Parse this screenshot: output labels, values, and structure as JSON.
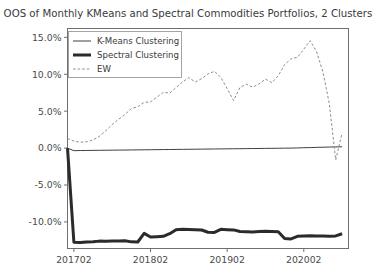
{
  "chart_data": {
    "type": "line",
    "title": "OOS of Monthly KMeans and Spectral Commodities Portfolios, 2 Clusters",
    "xlabel": "",
    "ylabel": "",
    "grid": false,
    "legend_position": "upper left",
    "xlim": [
      0,
      44
    ],
    "ylim": [
      -13.6,
      16.2
    ],
    "ytick_labels": [
      "15.0%",
      "10.0%",
      "5.0%",
      "0.0%",
      "-5.0%",
      "-10.0%"
    ],
    "ytick_values": [
      15.0,
      10.0,
      5.0,
      0.0,
      -5.0,
      -10.0
    ],
    "xtick_labels": [
      "201702",
      "201802",
      "201902",
      "202002"
    ],
    "xtick_values": [
      1,
      13,
      25,
      37
    ],
    "x": [
      0,
      1,
      2,
      3,
      4,
      5,
      6,
      7,
      8,
      9,
      10,
      11,
      12,
      13,
      14,
      15,
      16,
      17,
      18,
      19,
      20,
      21,
      22,
      23,
      24,
      25,
      26,
      27,
      28,
      29,
      30,
      31,
      32,
      33,
      34,
      35,
      36,
      37,
      38,
      39,
      40,
      41,
      42,
      43
    ],
    "series": [
      {
        "name": "K-Means Clustering",
        "style": "solid-thin",
        "color": "#3f3f3f",
        "linewidth": 1.0,
        "values": [
          0.0,
          -0.35,
          -0.33,
          -0.32,
          -0.31,
          -0.3,
          -0.29,
          -0.28,
          -0.27,
          -0.26,
          -0.25,
          -0.24,
          -0.23,
          -0.22,
          -0.21,
          -0.2,
          -0.19,
          -0.18,
          -0.17,
          -0.16,
          -0.15,
          -0.14,
          -0.13,
          -0.12,
          -0.11,
          -0.1,
          -0.09,
          -0.08,
          -0.07,
          -0.06,
          -0.05,
          -0.04,
          -0.03,
          -0.02,
          -0.01,
          0.0,
          0.02,
          0.05,
          0.07,
          0.1,
          0.12,
          0.14,
          0.16,
          0.18
        ]
      },
      {
        "name": "Spectral Clustering",
        "style": "solid-thick",
        "color": "#2b2b2b",
        "linewidth": 3.0,
        "values": [
          0.0,
          -12.75,
          -12.8,
          -12.72,
          -12.68,
          -12.6,
          -12.62,
          -12.58,
          -12.6,
          -12.55,
          -12.7,
          -12.72,
          -11.55,
          -12.05,
          -12.0,
          -11.95,
          -11.6,
          -11.05,
          -11.0,
          -11.02,
          -11.05,
          -11.1,
          -11.4,
          -11.42,
          -11.0,
          -11.05,
          -11.08,
          -11.3,
          -11.32,
          -11.35,
          -11.3,
          -11.28,
          -11.3,
          -11.32,
          -12.25,
          -12.3,
          -11.95,
          -11.9,
          -11.88,
          -11.9,
          -11.92,
          -11.95,
          -11.9,
          -11.6
        ]
      },
      {
        "name": "EW",
        "style": "dashed",
        "color": "#8d8d8d",
        "linewidth": 1.0,
        "values": [
          1.3,
          0.95,
          0.8,
          0.85,
          1.1,
          1.6,
          2.35,
          3.2,
          3.9,
          4.55,
          5.35,
          5.6,
          6.2,
          6.25,
          6.9,
          7.55,
          7.45,
          8.2,
          8.95,
          9.55,
          8.95,
          9.4,
          10.05,
          10.4,
          9.6,
          8.05,
          6.45,
          8.2,
          8.65,
          8.25,
          8.7,
          9.35,
          8.85,
          9.8,
          11.3,
          12.1,
          12.3,
          13.4,
          14.55,
          13.05,
          10.3,
          6.0,
          -1.6,
          2.05
        ]
      }
    ]
  },
  "legend": {
    "entries": [
      {
        "label": "K-Means Clustering",
        "style": "solid-thin"
      },
      {
        "label": "Spectral Clustering",
        "style": "solid-thick"
      },
      {
        "label": "EW",
        "style": "dashed"
      }
    ]
  },
  "colors": {
    "kmeans": "#3f3f3f",
    "spectral": "#2b2b2b",
    "ew": "#8d8d8d",
    "axis": "#6f6f6f",
    "text": "#3a3a3a",
    "background": "#ffffff"
  }
}
